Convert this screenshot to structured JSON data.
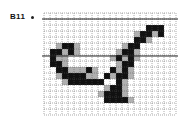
{
  "figure": {
    "label": "B11",
    "glyph": "A",
    "grid": {
      "x0": 44,
      "y0": 13,
      "cell": 6,
      "cols": 22,
      "rows": 17
    },
    "guide_lines_y": [
      19,
      56
    ],
    "colors": {
      "ink": "#111111",
      "gray": "#b0b0b0",
      "grid": "#555555"
    },
    "black_cells": [
      [
        17,
        2
      ],
      [
        18,
        2
      ],
      [
        19,
        2
      ],
      [
        16,
        3
      ],
      [
        17,
        3
      ],
      [
        19,
        3
      ],
      [
        15,
        4
      ],
      [
        16,
        4
      ],
      [
        15,
        5
      ],
      [
        14,
        5
      ],
      [
        13,
        6
      ],
      [
        14,
        6
      ],
      [
        12,
        7
      ],
      [
        14,
        7
      ],
      [
        14,
        8
      ],
      [
        13,
        8
      ],
      [
        11,
        9
      ],
      [
        13,
        9
      ],
      [
        10,
        10
      ],
      [
        13,
        10
      ],
      [
        12,
        10
      ],
      [
        8,
        11
      ],
      [
        9,
        11
      ],
      [
        12,
        11
      ],
      [
        12,
        12
      ],
      [
        11,
        12
      ],
      [
        11,
        13
      ],
      [
        12,
        13
      ],
      [
        10,
        13
      ],
      [
        10,
        14
      ],
      [
        11,
        14
      ],
      [
        12,
        14
      ],
      [
        13,
        14
      ],
      [
        3,
        5
      ],
      [
        4,
        5
      ],
      [
        1,
        6
      ],
      [
        2,
        6
      ],
      [
        4,
        6
      ],
      [
        1,
        7
      ],
      [
        1,
        8
      ],
      [
        2,
        8
      ],
      [
        2,
        9
      ],
      [
        3,
        9
      ],
      [
        7,
        9
      ],
      [
        3,
        10
      ],
      [
        4,
        10
      ],
      [
        5,
        10
      ],
      [
        6,
        10
      ],
      [
        4,
        11
      ],
      [
        5,
        11
      ],
      [
        6,
        11
      ],
      [
        7,
        11
      ]
    ],
    "gray_cells": [
      [
        15,
        3
      ],
      [
        18,
        3
      ],
      [
        17,
        4
      ],
      [
        13,
        5
      ],
      [
        15,
        6
      ],
      [
        12,
        6
      ],
      [
        11,
        7
      ],
      [
        13,
        7
      ],
      [
        15,
        7
      ],
      [
        12,
        8
      ],
      [
        14,
        9
      ],
      [
        12,
        9
      ],
      [
        11,
        10
      ],
      [
        14,
        10
      ],
      [
        13,
        11
      ],
      [
        7,
        10
      ],
      [
        8,
        10
      ],
      [
        10,
        12
      ],
      [
        13,
        12
      ],
      [
        9,
        13
      ],
      [
        13,
        13
      ],
      [
        14,
        14
      ],
      [
        2,
        5
      ],
      [
        5,
        5
      ],
      [
        3,
        6
      ],
      [
        5,
        6
      ],
      [
        2,
        7
      ],
      [
        3,
        7
      ],
      [
        3,
        8
      ],
      [
        4,
        9
      ],
      [
        5,
        9
      ],
      [
        6,
        9
      ],
      [
        8,
        9
      ],
      [
        2,
        10
      ],
      [
        7,
        10
      ],
      [
        3,
        11
      ],
      [
        8,
        11
      ]
    ]
  }
}
